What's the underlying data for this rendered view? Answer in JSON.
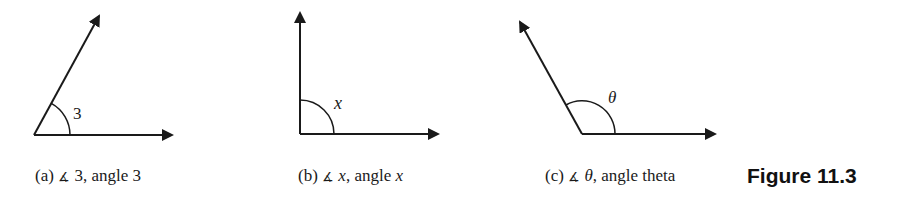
{
  "figure": {
    "title": "Figure 11.3",
    "panels": [
      {
        "id": "a",
        "prefix": "(a) ",
        "angle_symbol": "∡",
        "name": " 3",
        "suffix": ", angle ",
        "suffix_var": "3",
        "angle_label": "3",
        "angle_label_italic": false
      },
      {
        "id": "b",
        "prefix": "(b) ",
        "angle_symbol": "∡",
        "name": " x",
        "suffix": ", angle ",
        "suffix_var": "x",
        "angle_label": "x",
        "angle_label_italic": true
      },
      {
        "id": "c",
        "prefix": "(c) ",
        "angle_symbol": "∡",
        "name": " θ",
        "suffix": ", angle theta",
        "suffix_var": "",
        "angle_label": "θ",
        "angle_label_italic": true
      }
    ]
  },
  "colors": {
    "stroke": "#1a1a1a",
    "background": "#ffffff"
  }
}
